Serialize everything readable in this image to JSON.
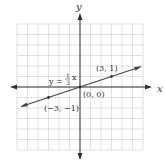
{
  "chart_data": {
    "type": "line",
    "title": "",
    "xlabel": "x",
    "ylabel": "y",
    "xlim": [
      -6,
      6
    ],
    "ylim": [
      -6,
      6
    ],
    "grid": true,
    "series": [
      {
        "name": "y = 1/3 x",
        "slope": 0.3333,
        "intercept": 0,
        "points": [
          {
            "x": -3,
            "y": -1,
            "label": "(−3, −1)"
          },
          {
            "x": 0,
            "y": 0,
            "label": "(0, 0)"
          },
          {
            "x": 3,
            "y": 1,
            "label": "(3, 1)"
          }
        ]
      }
    ],
    "annotations": [
      {
        "text": "y = 1/3 x"
      }
    ]
  },
  "labels": {
    "x_axis": "x",
    "y_axis": "y",
    "eq_y": "y =",
    "eq_num": "1",
    "eq_den": "3",
    "eq_x": "x",
    "p1": "(3, 1)",
    "p0": "(0, 0)",
    "p2": "(−3, −1)"
  },
  "colors": {
    "grid": "#cccccc",
    "axis": "#333333",
    "line": "#444444"
  }
}
